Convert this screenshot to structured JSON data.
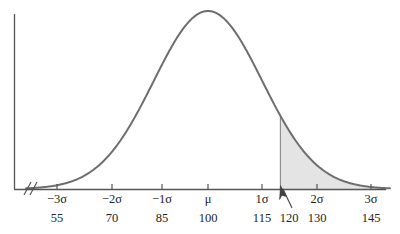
{
  "figure": {
    "background_color": "#ffffff",
    "curve_color": "#6e6e6e",
    "axis_color": "#555555",
    "shade_color": "#e4e4e4",
    "shade_edge_color": "#8a8a8a",
    "text_color": "#232323",
    "arrow_color": "#404040"
  },
  "axis": {
    "break_symbol": "//",
    "has_y_axis": true,
    "has_x_axis": true
  },
  "annotation": {
    "arrow_name": "pointer-arrow",
    "points_to_value": "120",
    "points_to_sigma": "1.33σ"
  },
  "chart_data": {
    "type": "area",
    "xlabel": "",
    "ylabel": "",
    "mean": 100,
    "std_dev": 15,
    "distribution": "normal",
    "xlim": [
      50,
      150
    ],
    "ylim": [
      0,
      1
    ],
    "grid": false,
    "legend": null,
    "sigma_tick_labels": [
      "−3σ",
      "−2σ",
      "−1σ",
      "μ",
      "1σ",
      "2σ",
      "3σ"
    ],
    "sigma_tick_values": [
      -3,
      -2,
      -1,
      0,
      1,
      2,
      3
    ],
    "value_tick_labels": [
      "55",
      "70",
      "85",
      "100",
      "115",
      "130",
      "145"
    ],
    "value_tick_values": [
      55,
      70,
      85,
      100,
      115,
      130,
      145
    ],
    "extra_value_label": "120",
    "extra_value": 120,
    "shaded_region": {
      "from": 120,
      "to": 150,
      "from_sigma": 1.3333,
      "to_sigma": 3,
      "fill": "#e4e4e4",
      "label": "right tail beyond 120"
    },
    "ticks": [
      {
        "sigma_label": "−3σ",
        "value_label": "55",
        "value": 55,
        "x_px": 57
      },
      {
        "sigma_label": "−2σ",
        "value_label": "70",
        "value": 70,
        "x_px": 112
      },
      {
        "sigma_label": "−1σ",
        "value_label": "85",
        "value": 85,
        "x_px": 162
      },
      {
        "sigma_label": "μ",
        "value_label": "100",
        "value": 100,
        "x_px": 208
      },
      {
        "sigma_label": "1σ",
        "value_label": "115",
        "value": 115,
        "x_px": 262
      },
      {
        "sigma_label": "2σ",
        "value_label": "130",
        "value": 130,
        "x_px": 317
      },
      {
        "sigma_label": "3σ",
        "value_label": "145",
        "value": 145,
        "x_px": 371
      }
    ],
    "marker_tick": {
      "value_label": "120",
      "value": 120,
      "x_px": 289
    }
  }
}
